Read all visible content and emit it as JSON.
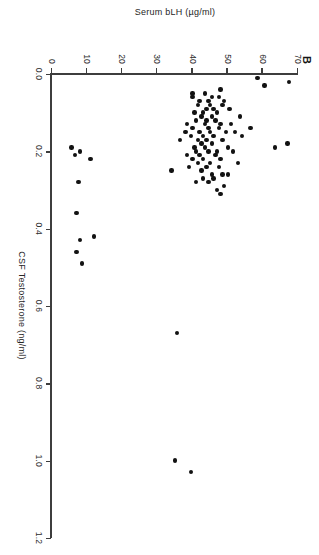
{
  "figure": {
    "panel_label": "B",
    "background_color": "#ffffff",
    "point_color": "#121212",
    "axis_color": "#3d3d3d",
    "orientation_note": "page-rotated-90-clockwise"
  },
  "chart_data": {
    "type": "scatter",
    "title": "B",
    "xlabel": "CSF Testosterone (ng/ml)",
    "ylabel": "Serum bLH (µg/ml)",
    "xlim": [
      0.0,
      1.2
    ],
    "ylim": [
      0,
      70
    ],
    "xticks": [
      0.0,
      0.2,
      0.4,
      0.6,
      0.8,
      1.0,
      1.2
    ],
    "xtick_labels": [
      "0.0",
      "0.2",
      "0.4",
      "0.6",
      "0.8",
      "1.0",
      "1.2"
    ],
    "yticks": [
      0,
      10,
      20,
      30,
      40,
      50,
      60,
      70
    ],
    "ytick_labels": [
      "0",
      "10",
      "20",
      "30",
      "40",
      "50",
      "60",
      "70"
    ],
    "grid": false,
    "legend": null,
    "marker": "filled-circle",
    "n_points": 96,
    "series": [
      {
        "name": "Individual animals",
        "x": [
          0.01,
          0.02,
          0.03,
          0.04,
          0.05,
          0.05,
          0.06,
          0.06,
          0.06,
          0.07,
          0.07,
          0.07,
          0.08,
          0.08,
          0.08,
          0.09,
          0.09,
          0.09,
          0.1,
          0.1,
          0.1,
          0.11,
          0.11,
          0.11,
          0.12,
          0.12,
          0.12,
          0.13,
          0.13,
          0.13,
          0.13,
          0.14,
          0.14,
          0.14,
          0.14,
          0.15,
          0.15,
          0.15,
          0.15,
          0.15,
          0.16,
          0.16,
          0.16,
          0.16,
          0.17,
          0.17,
          0.17,
          0.17,
          0.18,
          0.18,
          0.18,
          0.19,
          0.19,
          0.19,
          0.19,
          0.2,
          0.2,
          0.2,
          0.2,
          0.2,
          0.21,
          0.21,
          0.21,
          0.21,
          0.22,
          0.22,
          0.22,
          0.22,
          0.23,
          0.23,
          0.23,
          0.24,
          0.24,
          0.24,
          0.25,
          0.25,
          0.26,
          0.26,
          0.26,
          0.27,
          0.27,
          0.28,
          0.28,
          0.28,
          0.29,
          0.3,
          0.31,
          0.36,
          0.42,
          0.43,
          0.46,
          0.49,
          0.67,
          1.0,
          1.03,
          0.19
        ],
        "y": [
          58.5,
          67.5,
          60.5,
          48.0,
          40.0,
          43.5,
          45.5,
          40.0,
          47.5,
          44.5,
          49.0,
          42.0,
          45.0,
          48.5,
          41.5,
          44.0,
          46.0,
          50.5,
          43.0,
          47.0,
          40.5,
          42.5,
          45.5,
          53.5,
          44.0,
          46.5,
          41.0,
          43.5,
          48.0,
          51.0,
          38.5,
          44.5,
          47.5,
          56.5,
          40.0,
          42.0,
          45.0,
          49.5,
          52.0,
          38.0,
          43.0,
          46.0,
          54.0,
          39.5,
          41.5,
          44.0,
          48.5,
          36.5,
          42.5,
          45.5,
          67.0,
          40.5,
          43.5,
          50.0,
          63.5,
          41.0,
          44.5,
          47.0,
          51.5,
          8.0,
          38.5,
          42.0,
          46.5,
          6.5,
          40.0,
          43.0,
          48.0,
          11.0,
          41.5,
          45.0,
          53.0,
          39.0,
          44.0,
          47.5,
          42.5,
          34.0,
          45.5,
          48.5,
          50.0,
          43.0,
          46.0,
          41.0,
          44.5,
          7.5,
          49.0,
          47.0,
          48.0,
          7.0,
          12.0,
          8.0,
          7.0,
          8.5,
          35.5,
          35.0,
          39.5,
          5.5
        ]
      }
    ]
  },
  "axis": {
    "x_title": "CSF Testosterone (ng/ml)",
    "y_title": "Serum bLH (µg/ml)"
  }
}
